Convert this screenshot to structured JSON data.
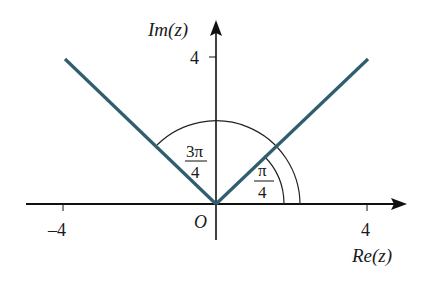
{
  "diagram": {
    "axes": {
      "x_label": "Re(z)",
      "y_label": "Im(z)",
      "x_ticks": [
        {
          "value": -4,
          "label": "–4"
        },
        {
          "value": 4,
          "label": "4"
        }
      ],
      "y_ticks": [
        {
          "value": 4,
          "label": "4"
        }
      ],
      "origin_label": "O"
    },
    "rays": [
      {
        "angle": "π/4",
        "from": [
          0,
          0
        ],
        "to": [
          4,
          4
        ]
      },
      {
        "angle": "3π/4",
        "from": [
          0,
          0
        ],
        "to": [
          -4,
          4
        ]
      }
    ],
    "angle_labels": {
      "inner": {
        "numerator": "π",
        "denominator": "4"
      },
      "outer": {
        "numerator": "3π",
        "denominator": "4"
      }
    },
    "colors": {
      "ray": "#2f5f6e",
      "axis": "#111111",
      "arc": "#222222"
    }
  }
}
